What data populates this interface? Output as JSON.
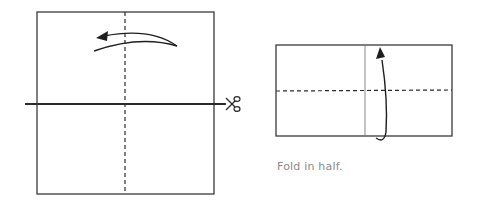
{
  "diagram": {
    "steps": [
      {
        "id": "step-1",
        "description": "Square sheet with vertical dashed valley fold and horizontal cut line",
        "icons": [
          "scissors-icon",
          "fold-arrow-left-icon"
        ]
      },
      {
        "id": "step-2",
        "description": "Rectangle with horizontal dashed fold line and upward fold arrow",
        "icons": [
          "fold-arrow-up-icon"
        ]
      }
    ],
    "caption": "Fold in half.",
    "colors": {
      "line": "#2a2a2a",
      "thin_line": "#7a7a7a",
      "caption": "#8a8a8a",
      "background": "#ffffff"
    }
  }
}
